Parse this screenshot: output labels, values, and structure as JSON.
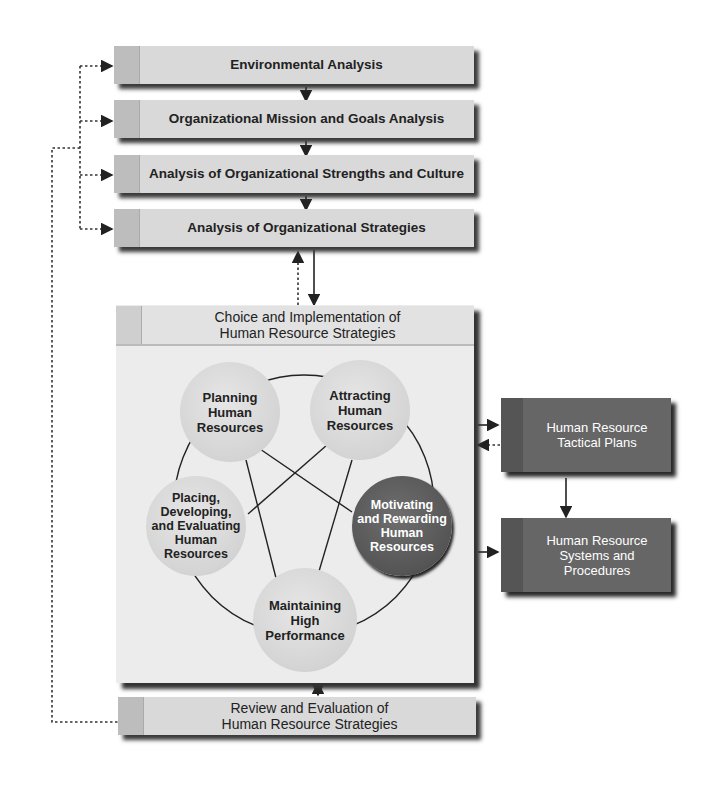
{
  "analysis_steps": [
    {
      "label": "Environmental Analysis"
    },
    {
      "label": "Organizational Mission and Goals Analysis"
    },
    {
      "label": "Analysis of Organizational Strengths and Culture"
    },
    {
      "label": "Analysis of Organizational Strategies"
    }
  ],
  "choice_panel": {
    "title_line1": "Choice and Implementation of",
    "title_line2": "Human Resource Strategies"
  },
  "activities": [
    {
      "line1": "Planning",
      "line2": "Human",
      "line3": "Resources"
    },
    {
      "line1": "Attracting",
      "line2": "Human",
      "line3": "Resources"
    },
    {
      "line1": "Placing,",
      "line2": "Developing,",
      "line3": "and Evaluating",
      "line4": "Human",
      "line5": "Resources"
    },
    {
      "line1": "Motivating",
      "line2": "and Rewarding",
      "line3": "Human",
      "line4": "Resources"
    },
    {
      "line1": "Maintaining",
      "line2": "High",
      "line3": "Performance"
    }
  ],
  "outputs": [
    {
      "line1": "Human Resource",
      "line2": "Tactical Plans"
    },
    {
      "line1": "Human Resource",
      "line2": "Systems and",
      "line3": "Procedures"
    }
  ],
  "review": {
    "line1": "Review and Evaluation of",
    "line2": "Human Resource Strategies"
  },
  "colors": {
    "bar_fill": "#d9d9d9",
    "panel_fill": "#ececec",
    "circle_light": "#d6d6d6",
    "circle_dark": "#555555",
    "output_box": "#666666"
  }
}
